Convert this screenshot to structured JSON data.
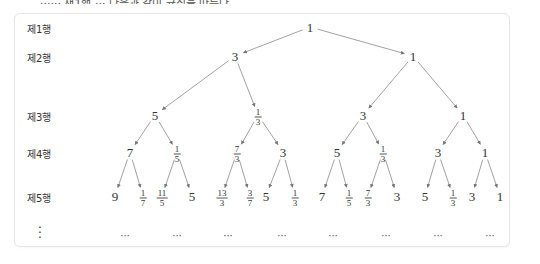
{
  "top_caption_partial": "······ 재1행 ··· 다음과 같이 규칙을 따른다",
  "row_labels": [
    "제1행",
    "제2행",
    "제3행",
    "제4행",
    "제5행"
  ],
  "row_continuation": "⋮",
  "ellipsis": "···",
  "tree": {
    "levels": [
      [
        {
          "n": "1"
        }
      ],
      [
        {
          "n": "3"
        },
        {
          "n": "1"
        }
      ],
      [
        {
          "n": "5"
        },
        {
          "n": "1",
          "d": "3"
        },
        {
          "n": "3"
        },
        {
          "n": "1"
        }
      ],
      [
        {
          "n": "7"
        },
        {
          "n": "1",
          "d": "5"
        },
        {
          "n": "7",
          "d": "3"
        },
        {
          "n": "3"
        },
        {
          "n": "5"
        },
        {
          "n": "1",
          "d": "3"
        },
        {
          "n": "3"
        },
        {
          "n": "1"
        }
      ],
      [
        {
          "n": "9"
        },
        {
          "n": "1",
          "d": "7"
        },
        {
          "n": "11",
          "d": "5"
        },
        {
          "n": "5"
        },
        {
          "n": "13",
          "d": "3"
        },
        {
          "n": "3",
          "d": "7"
        },
        {
          "n": "5"
        },
        {
          "n": "1",
          "d": "3"
        },
        {
          "n": "7"
        },
        {
          "n": "1",
          "d": "5"
        },
        {
          "n": "7",
          "d": "3"
        },
        {
          "n": "3"
        },
        {
          "n": "5"
        },
        {
          "n": "1",
          "d": "3"
        },
        {
          "n": "3"
        },
        {
          "n": "1"
        }
      ]
    ]
  },
  "layout": {
    "row_y": [
      27,
      56,
      115,
      152,
      196
    ],
    "label_y": [
      22,
      51,
      110,
      147,
      191
    ],
    "dots_y": 235,
    "x": [
      [
        310
      ],
      [
        235,
        413
      ],
      [
        155,
        258,
        363,
        463
      ],
      [
        130,
        177,
        237,
        283,
        337,
        383,
        438,
        485
      ],
      [
        115,
        143,
        162,
        192,
        222,
        250,
        266,
        295,
        322,
        349,
        368,
        397,
        425,
        453,
        472,
        500
      ]
    ],
    "dots_x": [
      125,
      177,
      228,
      282,
      333,
      386,
      438,
      490
    ]
  },
  "colors": {
    "edge": "#8a8a8a",
    "text": "#333333",
    "border": "#e6e6e6"
  }
}
